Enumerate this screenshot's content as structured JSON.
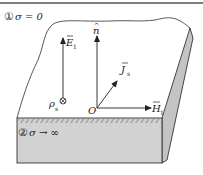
{
  "figure": {
    "region1_label": {
      "number": "①",
      "text": "σ = 0"
    },
    "region2_label": {
      "number": "②",
      "text": "σ → ∞"
    },
    "vectors": {
      "E": {
        "symbol": "E",
        "subscript": "1"
      },
      "n": {
        "symbol": "n"
      },
      "J": {
        "symbol": "J",
        "subscript": "s"
      },
      "H": {
        "symbol": "H",
        "subscript": "1"
      }
    },
    "origin_label": "O",
    "charge": {
      "symbol": "ρ",
      "subscript": "s",
      "marker": "⊗"
    }
  },
  "colors": {
    "line": "#333333",
    "top_border": "#555555",
    "conductor_fill": "#d2d2d2",
    "side_fill": "#c4c4c4",
    "hatch": "#8a8a8a"
  }
}
